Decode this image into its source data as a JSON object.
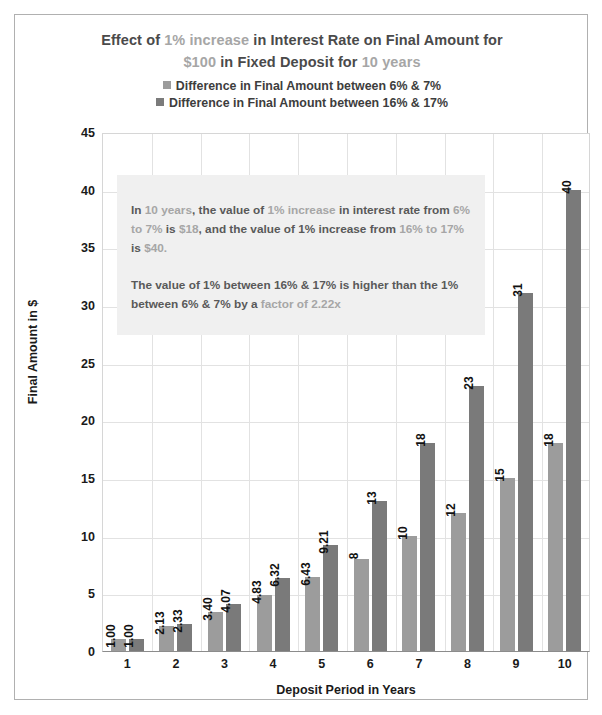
{
  "chart_data": {
    "type": "bar",
    "title_line1_parts": [
      {
        "text": "Effect of ",
        "muted": false
      },
      {
        "text": "1% increase",
        "muted": true
      },
      {
        "text": " in Interest Rate on Final Amount for",
        "muted": false
      }
    ],
    "title_line2_parts": [
      {
        "text": "$100",
        "muted": true
      },
      {
        "text": " in Fixed Deposit for ",
        "muted": false
      },
      {
        "text": "10 years",
        "muted": true
      }
    ],
    "title_plain": "Effect of 1% increase in Interest Rate on Final Amount for $100 in Fixed Deposit for 10 years",
    "xlabel": "Deposit Period in Years",
    "ylabel": "Final Amount in $",
    "ylim": [
      0,
      45
    ],
    "ytick_values": [
      45,
      40,
      35,
      30,
      25,
      20,
      15,
      10,
      5,
      0
    ],
    "categories": [
      "1",
      "2",
      "3",
      "4",
      "5",
      "6",
      "7",
      "8",
      "9",
      "10"
    ],
    "grid": true,
    "legend_position": "top-center",
    "series": [
      {
        "name": "Difference in Final Amount between 6% & 7%",
        "color": "#9c9c9c",
        "values": [
          1.0,
          2.13,
          3.4,
          4.83,
          6.43,
          8,
          10,
          12,
          15,
          18
        ],
        "labels": [
          "1.00",
          "2.13",
          "3.40",
          "4.83",
          "6.43",
          "8",
          "10",
          "12",
          "15",
          "18"
        ]
      },
      {
        "name": "Difference in Final Amount between 16% & 17%",
        "color": "#7a7a7a",
        "values": [
          1.0,
          2.33,
          4.07,
          6.32,
          9.21,
          13,
          18,
          23,
          31,
          40
        ],
        "labels": [
          "1.00",
          "2.33",
          "4.07",
          "6.32",
          "9.21",
          "13",
          "18",
          "23",
          "31",
          "40"
        ]
      }
    ],
    "annotation": {
      "paragraph1_parts": [
        {
          "text": "In ",
          "muted": false
        },
        {
          "text": "10 years",
          "muted": true
        },
        {
          "text": ", the value of ",
          "muted": false
        },
        {
          "text": "1% increase",
          "muted": true
        },
        {
          "text": " in interest rate from ",
          "muted": false
        },
        {
          "text": "6% to 7%",
          "muted": true
        },
        {
          "text": " is ",
          "muted": false
        },
        {
          "text": "$18",
          "muted": true
        },
        {
          "text": ", and the value of 1% increase from ",
          "muted": false
        },
        {
          "text": "16% to 17%",
          "muted": true
        },
        {
          "text": " is ",
          "muted": false
        },
        {
          "text": "$40.",
          "muted": true
        }
      ],
      "paragraph2_parts": [
        {
          "text": "The value of 1% between 16% & 17% is higher than the 1% between 6% & 7% by a ",
          "muted": false
        },
        {
          "text": "factor of 2.22x",
          "muted": true
        }
      ],
      "paragraph1_plain": "In 10 years, the value of 1% increase in interest rate from 6% to 7% is $18, and the value of 1% increase from 16% to 17% is $40.",
      "paragraph2_plain": "The value of 1% between 16% & 17% is higher than the 1% between 6% & 7% by a factor of 2.22x"
    }
  }
}
